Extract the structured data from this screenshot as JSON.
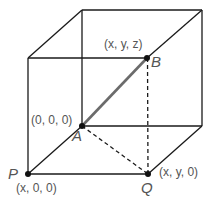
{
  "diagram": {
    "title": "",
    "type": "cube-coordinates",
    "colors": {
      "edge": "#1a1a1a",
      "highlight_segment": "#6b6b6b",
      "label": "#555555",
      "background": "#ffffff"
    },
    "points": {
      "A": {
        "name": "A",
        "coords": "(0, 0, 0)"
      },
      "B": {
        "name": "B",
        "coords": "(x, y, z)"
      },
      "P": {
        "name": "P",
        "coords": "(x, 0, 0)"
      },
      "Q": {
        "name": "Q",
        "coords": "(x, y, 0)"
      }
    },
    "edges": {
      "solid": [
        "front-left-vertical",
        "front-top",
        "front-bottom",
        "back-top",
        "back-left-vertical",
        "back-right-vertical",
        "back-bottom",
        "top-left-depth",
        "top-right-depth",
        "bottom-right-depth",
        "bottom-left-depth"
      ],
      "dashed": [
        "B-Q",
        "A-Q"
      ],
      "highlighted": [
        "A-B"
      ]
    }
  }
}
